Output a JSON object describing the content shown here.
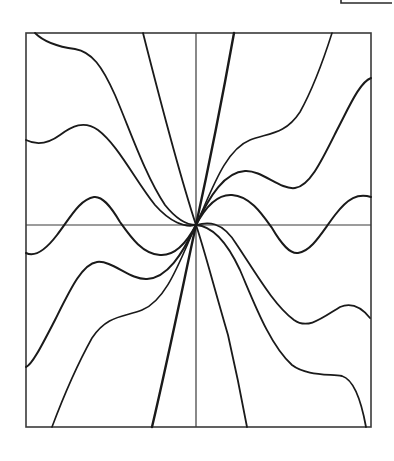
{
  "figure": {
    "frame": {
      "x": 26,
      "y": 33,
      "width": 345,
      "height": 394
    },
    "origin": {
      "x": 196,
      "y": 225
    },
    "axes": {
      "horizontal": {
        "x1": 26,
        "y1": 225,
        "x2": 371,
        "y2": 225
      },
      "vertical": {
        "x1": 196,
        "y1": 33,
        "x2": 196,
        "y2": 427
      }
    },
    "colors": {
      "line": "#1a1a1a",
      "frame": "#3a3a3a",
      "background": "#ffffff"
    },
    "corner_fragment": "M341 0 L341 3 L392 3",
    "curves": [
      {
        "name": "steep-line",
        "width": 2.4,
        "d": "M234 33 C 222 100, 208 170, 196 225 C 184 280, 170 350, 152 427"
      },
      {
        "name": "near-vertical-curve",
        "width": 1.8,
        "d": "M143 33 C 160 100, 178 170, 196 225 C 203 245, 212 280, 228 335 C 236 370, 242 400, 247 427"
      },
      {
        "name": "curve-plateau-upper",
        "width": 1.6,
        "d": "M196 225 C 212 190, 225 150, 250 140 C 268 133, 285 135, 300 112 C 315 85, 325 55, 332 33"
      },
      {
        "name": "curve-plateau-lower",
        "width": 1.6,
        "d": "M196 225 C 180 260, 167 300, 142 310 C 124 317, 107 315, 92 338 C 77 365, 64 395, 52 427"
      },
      {
        "name": "curve-wave-upper",
        "width": 2.0,
        "d": "M196 225 C 210 195, 225 172, 245 171 C 262 170, 280 190, 295 188 C 310 186, 322 160, 337 130 C 350 105, 360 82, 371 78"
      },
      {
        "name": "curve-wave-lower",
        "width": 2.0,
        "d": "M196 225 C 182 255, 167 278, 147 279 C 130 280, 112 260, 97 262 C 82 264, 70 290, 55 320 C 42 345, 32 365, 26 367"
      },
      {
        "name": "curve-oscillating-right",
        "width": 2.0,
        "d": "M196 225 C 206 206, 218 194, 232 195 C 250 196, 262 214, 272 228 C 282 245, 290 254, 298 253 C 312 251, 322 232, 335 215 C 348 198, 358 193, 371 197"
      },
      {
        "name": "curve-oscillating-left",
        "width": 2.0,
        "d": "M196 225 C 186 244, 174 256, 160 255 C 142 254, 130 236, 120 222 C 110 205, 102 196, 94 197 C 80 199, 70 218, 57 235 C 44 252, 34 257, 26 253"
      },
      {
        "name": "curve-shallow-left",
        "width": 1.8,
        "d": "M26 140 C 34 144, 45 146, 60 135 C 72 126, 84 120, 98 130 C 118 145, 135 180, 155 205 C 170 222, 185 228, 196 225"
      },
      {
        "name": "curve-shallow-right",
        "width": 1.8,
        "d": "M196 225 C 207 222, 222 220, 237 245 C 257 275, 274 305, 294 320 C 308 330, 322 318, 340 307 C 352 302, 362 308, 370 318"
      },
      {
        "name": "curve-outer-upper-left",
        "width": 1.8,
        "d": "M35 33 C 42 40, 52 46, 75 49 C 92 52, 102 66, 115 95 C 130 130, 145 175, 165 205 C 177 220, 188 225, 196 225"
      },
      {
        "name": "curve-outer-lower-right",
        "width": 1.8,
        "d": "M196 225 C 212 226, 226 240, 240 270 C 255 305, 270 345, 292 365 C 305 375, 325 374, 342 376 C 355 380, 362 405, 366 427"
      }
    ]
  }
}
